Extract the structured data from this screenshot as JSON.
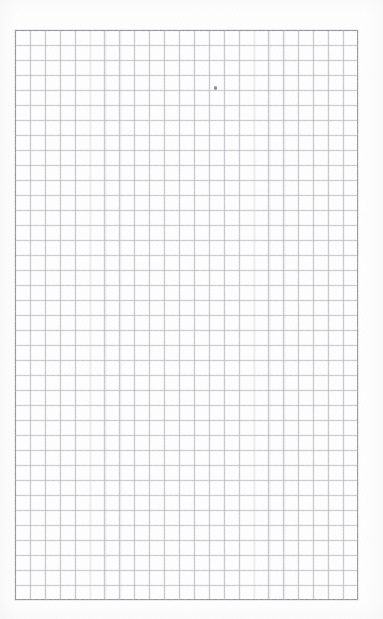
{
  "document": {
    "kind": "grid-paper-scan",
    "title": "Blank quadrille grid paper",
    "caption": "A scanned blank sheet of quadrille (graph) paper with a ruled square grid and no writing.",
    "background_color": "#ffffff",
    "paper_color": "#fefefe",
    "page": {
      "width": 383,
      "height": 619
    }
  },
  "grid": {
    "name": "square-grid",
    "left": 15,
    "top": 30,
    "width": 343,
    "height": 570,
    "columns": 23,
    "rows": 38,
    "cell_width": 14.91,
    "cell_height": 15.0,
    "line_color": "#b0b0b8",
    "line_width": 0.9,
    "border_color": "#96969e",
    "border_width": 1
  },
  "marks": [
    {
      "name": "pencil-dot",
      "label": "faint pencil dot",
      "x": 215,
      "y": 88,
      "color": "#8a8a92"
    }
  ],
  "artifacts": {
    "vignette": true,
    "grain": true,
    "ink_bleed": true
  }
}
